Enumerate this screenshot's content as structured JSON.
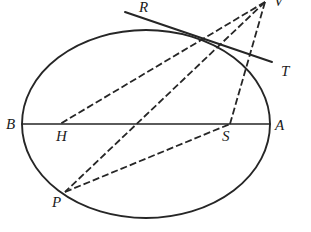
{
  "figure": {
    "kind": "geometry-diagram",
    "background_color": "#ffffff",
    "stroke_color": "#262626",
    "title_visible": false,
    "canvas": {
      "width": 311,
      "height": 232
    },
    "conic": {
      "name": "ellipse",
      "center": [
        146,
        124
      ],
      "radius_x": 124,
      "radius_y": 94,
      "stroke_width": 1.9,
      "style": "solid"
    },
    "points": [
      {
        "id": "B",
        "label": "B",
        "x": 22,
        "y": 124,
        "label_x": 6,
        "label_y": 117,
        "on": "ellipse-left"
      },
      {
        "id": "A",
        "label": "A",
        "x": 270,
        "y": 124,
        "label_x": 275,
        "label_y": 118,
        "on": "ellipse-right"
      },
      {
        "id": "H",
        "label": "H",
        "x": 60,
        "y": 124,
        "label_x": 56,
        "label_y": 129,
        "on": "chord-BA"
      },
      {
        "id": "S",
        "label": "S",
        "x": 230,
        "y": 124,
        "label_x": 222,
        "label_y": 129,
        "on": "chord-BA"
      },
      {
        "id": "P",
        "label": "P",
        "x": 65,
        "y": 192,
        "label_x": 52,
        "label_y": 195,
        "on": "ellipse-lower-left"
      },
      {
        "id": "R",
        "label": "R",
        "x": 125,
        "y": 12,
        "label_x": 139,
        "label_y": 0,
        "on": "secant-end"
      },
      {
        "id": "T",
        "label": "T",
        "x": 272,
        "y": 62,
        "label_x": 281,
        "label_y": 64,
        "on": "secant-end"
      },
      {
        "id": "V",
        "label": "V",
        "x": 265,
        "y": 2,
        "label_x": 274,
        "label_y": -4,
        "on": "pole-vertex-clipped"
      }
    ],
    "solid_segments": [
      {
        "id": "chord-BA",
        "from": "B",
        "to": "A",
        "x1": 22,
        "y1": 124,
        "x2": 270,
        "y2": 124,
        "width": 1.7
      },
      {
        "id": "secant-RT",
        "from": "R",
        "to": "T",
        "x1": 125,
        "y1": 12,
        "x2": 272,
        "y2": 62,
        "width": 1.9
      }
    ],
    "dashed_segments": [
      {
        "id": "VH",
        "from": "V",
        "to": "H",
        "x1": 265,
        "y1": 2,
        "x2": 60,
        "y2": 124,
        "width": 1.8
      },
      {
        "id": "VP",
        "from": "V",
        "to": "P",
        "x1": 265,
        "y1": 2,
        "x2": 65,
        "y2": 192,
        "width": 1.8
      },
      {
        "id": "VS",
        "from": "V",
        "to": "S",
        "x1": 265,
        "y1": 2,
        "x2": 230,
        "y2": 124,
        "width": 1.8
      },
      {
        "id": "PS",
        "from": "P",
        "to": "S",
        "x1": 65,
        "y1": 192,
        "x2": 230,
        "y2": 124,
        "width": 1.8
      }
    ],
    "dash_pattern": "7 3",
    "labels_note": "italic serif capitals"
  }
}
